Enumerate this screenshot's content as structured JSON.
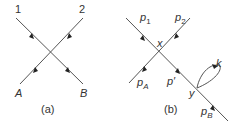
{
  "panel_a": {
    "caption": "(a)",
    "labels": {
      "top_left": "1",
      "top_right": "2",
      "bottom_left": "A",
      "bottom_right": "B"
    }
  },
  "panel_b": {
    "caption": "(b)",
    "labels": {
      "p1": {
        "base": "p",
        "sub": "1"
      },
      "p2": {
        "base": "p",
        "sub": "2"
      },
      "pA": {
        "base": "p",
        "sub": "A"
      },
      "pB": {
        "base": "p",
        "sub": "B"
      },
      "p_prime": "p′",
      "vertex_x": "x",
      "vertex_y": "y",
      "loop": "k"
    }
  },
  "colors": {
    "line": "#555555",
    "text": "#333333"
  }
}
